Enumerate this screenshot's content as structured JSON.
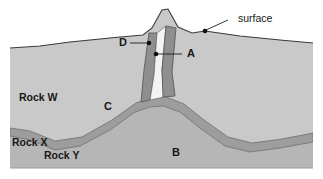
{
  "figure": {
    "type": "geologic-cross-section",
    "title": "",
    "background_color": "#ffffff"
  },
  "colors": {
    "sky": "#ffffff",
    "rock_w": "#c9c9c9",
    "rock_y": "#b6b6b6",
    "rock_x": "#9d9d9d",
    "dike": "#8f8f8f",
    "dike_outline": "#4a4a4a",
    "fissure": "#f3f3f3",
    "surface_line": "#3a3a3a",
    "text": "#181818"
  },
  "callouts": [
    {
      "id": "surface",
      "label": "surface",
      "text_x": 238,
      "text_y": 22,
      "leader": "M 206,30 L 228,20",
      "dot_x": 205,
      "dot_y": 31
    }
  ],
  "point_labels": [
    {
      "id": "A",
      "label": "A",
      "text_x": 187,
      "text_y": 57,
      "leader": "M 157,54 L 182,54",
      "dot_x": 156,
      "dot_y": 54
    },
    {
      "id": "B",
      "label": "B",
      "text_x": 172,
      "text_y": 156,
      "leader": "",
      "dot_x": null,
      "dot_y": null
    },
    {
      "id": "C",
      "label": "C",
      "text_x": 104,
      "text_y": 110,
      "leader": "",
      "dot_x": null,
      "dot_y": null
    },
    {
      "id": "D",
      "label": "D",
      "text_x": 119,
      "text_y": 46,
      "leader": "M 148,43 L 130,43",
      "dot_x": 149,
      "dot_y": 43
    }
  ],
  "unit_labels": [
    {
      "id": "rock-w",
      "label": "Rock W",
      "text_x": 19,
      "text_y": 101
    },
    {
      "id": "rock-x",
      "label": "Rock X",
      "text_x": 12,
      "text_y": 146
    },
    {
      "id": "rock-y",
      "label": "Rock Y",
      "text_x": 44,
      "text_y": 159
    }
  ],
  "geometry": {
    "surface_path": "M 10,48 L 40,46 L 70,42 L 100,39 L 120,37 L 143,35 L 152,28 L 162,10 L 168,9 L 178,27 L 192,33 L 205,31 L 240,36 L 280,40 L 313,43",
    "rock_w_fill": "M 10,48 L 40,46 L 70,42 L 100,39 L 120,37 L 143,35 L 152,28 L 162,10 L 168,9 L 178,27 L 192,33 L 205,31 L 240,36 L 280,40 L 313,43 L 313,168 L 10,168 Z",
    "rock_y_fill": "M 10,136 L 30,140 L 55,150 L 80,146 L 110,130 L 135,112 L 150,107 L 163,106 L 180,112 L 200,128 L 225,146 L 250,152 L 280,148 L 313,142 L 313,168 L 10,168 Z",
    "rock_x_band": "M 10,128 L 30,131 L 55,141 L 82,137 L 112,120 L 136,103 L 150,98 L 166,97 L 184,104 L 204,120 L 228,137 L 252,143 L 282,139 L 313,133 L 313,142 L 280,148 L 250,152 L 225,146 L 200,128 L 180,112 L 163,106 L 150,107 L 135,112 L 110,130 L 80,146 L 55,150 L 30,140 L 10,136 Z",
    "dike_left": "M 149,33 L 157,33 L 154,75 L 150,100 L 141,102 L 144,70 Z",
    "dike_right": "M 166,26 L 176,28 L 172,72 L 175,96 L 163,97 L 162,70 Z",
    "fissure": "M 157,33 L 166,26 L 162,70 L 164,97 L 150,100 L 154,75 Z"
  },
  "layer_order": [
    "rock_w",
    "rock_y",
    "rock_x",
    "dike_left",
    "fissure",
    "dike_right"
  ]
}
